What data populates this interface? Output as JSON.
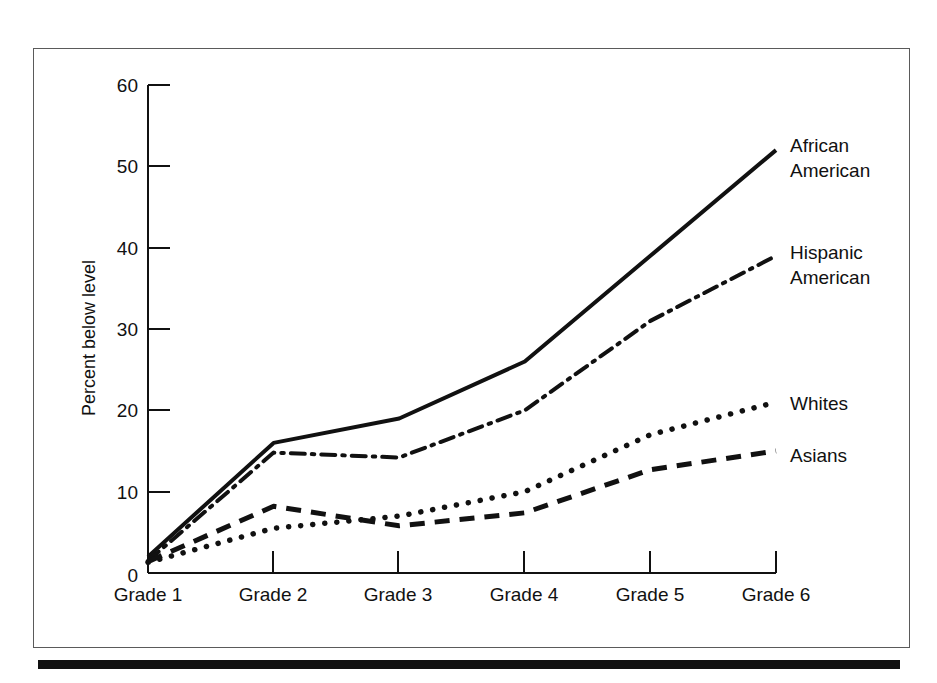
{
  "chart_data": {
    "type": "line",
    "title": "",
    "xlabel": "",
    "ylabel": "Percent below level",
    "categories": [
      "Grade 1",
      "Grade 2",
      "Grade 3",
      "Grade 4",
      "Grade 5",
      "Grade 6"
    ],
    "ylim": [
      0,
      60
    ],
    "yticks": [
      0,
      10,
      20,
      30,
      40,
      50,
      60
    ],
    "grid": false,
    "legend_position": "right-end-of-line",
    "series": [
      {
        "name": "African American",
        "label_lines": [
          "African",
          "American"
        ],
        "style": "solid",
        "values": [
          2,
          16,
          19,
          26,
          39,
          52
        ]
      },
      {
        "name": "Hispanic American",
        "label_lines": [
          "Hispanic",
          "American"
        ],
        "style": "dash-dot",
        "values": [
          1.5,
          14.8,
          14.2,
          20,
          31,
          39
        ]
      },
      {
        "name": "Whites",
        "label_lines": [
          "Whites"
        ],
        "style": "dotted",
        "values": [
          1.3,
          5.5,
          7,
          10,
          17,
          21
        ]
      },
      {
        "name": "Asians",
        "label_lines": [
          "Asians"
        ],
        "style": "dashed",
        "values": [
          1.4,
          8.2,
          5.8,
          7.4,
          12.7,
          15
        ]
      }
    ]
  },
  "yaxis": {
    "title": "Percent below level",
    "ticks": [
      "0",
      "10",
      "20",
      "30",
      "40",
      "50",
      "60"
    ]
  },
  "xaxis": {
    "ticks": [
      "Grade 1",
      "Grade 2",
      "Grade 3",
      "Grade 4",
      "Grade 5",
      "Grade 6"
    ]
  },
  "series_labels": {
    "african_american_1": "African",
    "african_american_2": "American",
    "hispanic_american_1": "Hispanic",
    "hispanic_american_2": "American",
    "whites": "Whites",
    "asians": "Asians"
  },
  "colors": {
    "ink": "#111111",
    "frame": "#5a5a5a",
    "background": "#ffffff"
  }
}
